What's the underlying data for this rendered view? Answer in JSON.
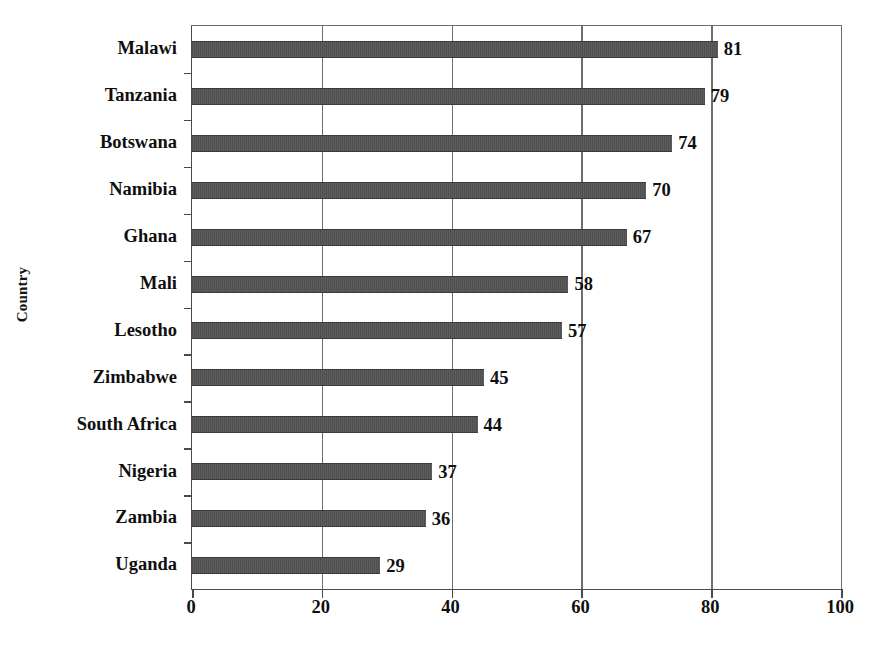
{
  "chart_data": {
    "type": "bar",
    "orientation": "horizontal",
    "title": "",
    "subtitle": "",
    "xlabel": "",
    "ylabel": "Country",
    "xlim": [
      0,
      100
    ],
    "xticks": [
      0,
      20,
      40,
      60,
      80,
      100
    ],
    "xtick_labels": [
      "0",
      "20",
      "40",
      "60",
      "80",
      "100"
    ],
    "grid": true,
    "grid_axis": "x",
    "legend": false,
    "legend_position": "none",
    "bar_color": "#555555",
    "axis_color": "#4a4a4a",
    "categories": [
      "Malawi",
      "Tanzania",
      "Botswana",
      "Namibia",
      "Ghana",
      "Mali",
      "Lesotho",
      "Zimbabwe",
      "South Africa",
      "Nigeria",
      "Zambia",
      "Uganda"
    ],
    "values": [
      81,
      79,
      74,
      70,
      67,
      58,
      57,
      45,
      44,
      37,
      36,
      29
    ],
    "value_labels": [
      "81",
      "79",
      "74",
      "70",
      "67",
      "58",
      "57",
      "45",
      "44",
      "37",
      "36",
      "29"
    ],
    "points": [
      {
        "category": "Malawi",
        "value": 81,
        "label": "81"
      },
      {
        "category": "Tanzania",
        "value": 79,
        "label": "79"
      },
      {
        "category": "Botswana",
        "value": 74,
        "label": "74"
      },
      {
        "category": "Namibia",
        "value": 70,
        "label": "70"
      },
      {
        "category": "Ghana",
        "value": 67,
        "label": "67"
      },
      {
        "category": "Mali",
        "value": 58,
        "label": "58"
      },
      {
        "category": "Lesotho",
        "value": 57,
        "label": "57"
      },
      {
        "category": "Zimbabwe",
        "value": 45,
        "label": "45"
      },
      {
        "category": "South Africa",
        "value": 44,
        "label": "44"
      },
      {
        "category": "Nigeria",
        "value": 37,
        "label": "37"
      },
      {
        "category": "Zambia",
        "value": 36,
        "label": "36"
      },
      {
        "category": "Uganda",
        "value": 29,
        "label": "29"
      }
    ]
  }
}
